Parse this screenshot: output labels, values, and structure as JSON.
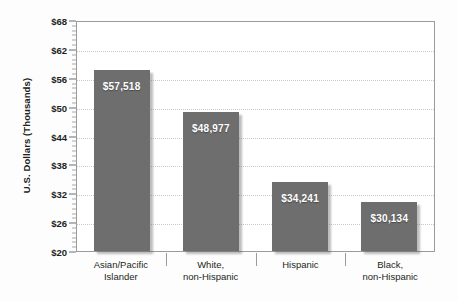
{
  "chart_data": {
    "type": "bar",
    "title": "",
    "subtitle": "",
    "xlabel": "",
    "ylabel": "U.S. Dollars (Thousands)",
    "ylim": [
      20,
      68
    ],
    "ytick_values": [
      20,
      26,
      32,
      38,
      44,
      50,
      56,
      62,
      68
    ],
    "ytick_labels": [
      "$20",
      "$26",
      "$32",
      "$38",
      "$44",
      "$50",
      "$56",
      "$62",
      "$68"
    ],
    "grid": true,
    "grid_axis": "y",
    "legend": false,
    "categories": [
      "Asian/Pacific Islander",
      "White, non-Hispanic",
      "Hispanic",
      "Black, non-Hispanic"
    ],
    "category_lines": [
      [
        "Asian/Pacific",
        "Islander"
      ],
      [
        "White,",
        "non-Hispanic"
      ],
      [
        "Hispanic",
        ""
      ],
      [
        "Black,",
        "non-Hispanic"
      ]
    ],
    "values": [
      57518,
      48977,
      34241,
      30134
    ],
    "value_labels": [
      "$57,518",
      "$48,977",
      "$34,241",
      "$30,134"
    ],
    "bar_color": "#6e6e6e",
    "value_label_color": "#ffffff",
    "plot_background": "#ffffff",
    "frame_color": "#9b9b9b",
    "gridline_color": "#c9c9c9",
    "page_background": "#fdfdfd"
  }
}
